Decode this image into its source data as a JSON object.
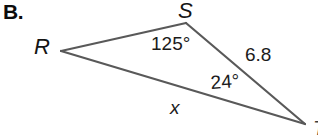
{
  "problem": {
    "letter": "B."
  },
  "figure": {
    "type": "triangle-diagram",
    "background_color": "#ffffff",
    "stroke_color": "#595959",
    "stroke_width": 2,
    "vertices": [
      {
        "name": "R",
        "label": "R",
        "x": 61,
        "y": 51
      },
      {
        "name": "S",
        "label": "S",
        "x": 186,
        "y": 23
      },
      {
        "name": "T",
        "label": "T",
        "x": 305,
        "y": 124
      }
    ],
    "edges": [
      {
        "name": "edge-rs",
        "from": "R",
        "to": "S"
      },
      {
        "name": "edge-st",
        "from": "S",
        "to": "T"
      },
      {
        "name": "edge-rt",
        "from": "R",
        "to": "T"
      }
    ],
    "angle_labels": [
      {
        "name": "angle-at-s",
        "text": "125°",
        "at_vertex": "S"
      },
      {
        "name": "angle-at-t",
        "text": "24°",
        "at_vertex": "T"
      }
    ],
    "side_labels": [
      {
        "name": "side-st",
        "text": "6.8",
        "edge": "edge-st"
      },
      {
        "name": "side-rt",
        "text": "x",
        "edge": "edge-rt"
      }
    ]
  }
}
